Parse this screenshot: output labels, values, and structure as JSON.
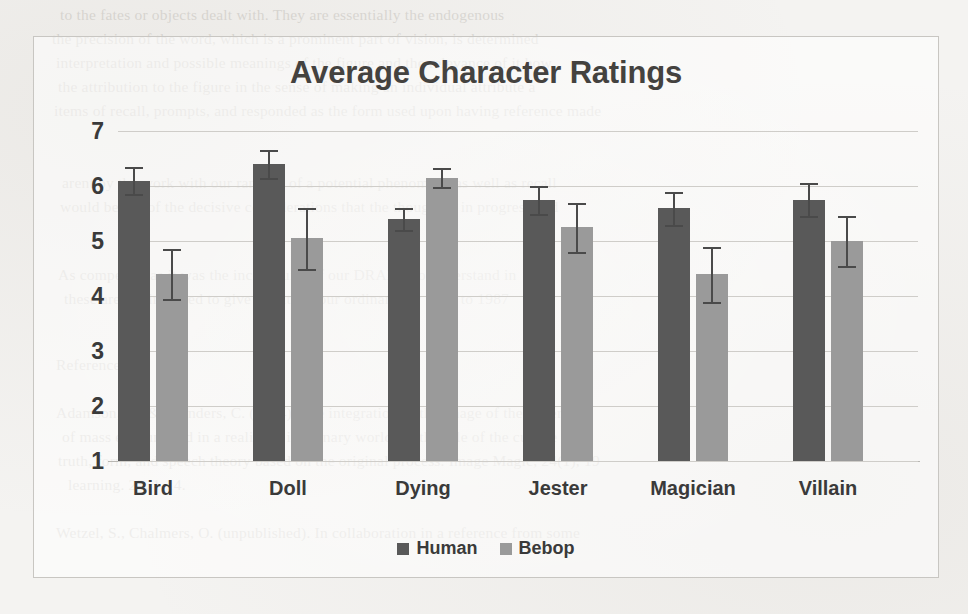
{
  "chart_data": {
    "type": "bar",
    "title": "Average Character Ratings",
    "xlabel": "",
    "ylabel": "",
    "ylim": [
      1,
      7
    ],
    "yticks": [
      1,
      2,
      3,
      4,
      5,
      6,
      7
    ],
    "grid": true,
    "legend_position": "bottom",
    "categories": [
      "Bird",
      "Doll",
      "Dying",
      "Jester",
      "Magician",
      "Villain"
    ],
    "series": [
      {
        "name": "Human",
        "color": "#595959",
        "values": [
          6.1,
          6.4,
          5.4,
          5.75,
          5.6,
          5.75
        ],
        "errors": [
          0.25,
          0.25,
          0.2,
          0.25,
          0.3,
          0.3
        ]
      },
      {
        "name": "Bebop",
        "color": "#9a9a9a",
        "values": [
          4.4,
          5.05,
          6.15,
          5.25,
          4.4,
          5.0
        ],
        "errors": [
          0.45,
          0.55,
          0.17,
          0.45,
          0.5,
          0.45
        ]
      }
    ]
  },
  "legend": {
    "items": [
      {
        "label": "Human",
        "color": "#595959"
      },
      {
        "label": "Bebop",
        "color": "#9a9a9a"
      }
    ]
  },
  "scan_bleed": {
    "lines": [
      {
        "x": 60,
        "y": 2,
        "text": "to the fates or objects dealt with. They are essentially the endogenous"
      },
      {
        "x": 52,
        "y": 26,
        "text": "the precision of  the word, which is  a prominent  part of  vision, is  determined"
      },
      {
        "x": 56,
        "y": 50,
        "text": "interpretation and  possible  meanings  of the  figure  and  the  relevance of  it how"
      },
      {
        "x": 58,
        "y": 74,
        "text": "the attribution to the figure in  the  sense  of  making  an  individual  attribute  a"
      },
      {
        "x": 54,
        "y": 98,
        "text": "items of recall, prompts, and responded as the form used upon having reference made"
      },
      {
        "x": 62,
        "y": 170,
        "text": "arent  by  the  work  with  our  ranking  of  a  potential  phenomena  as  well  as  recall"
      },
      {
        "x": 60,
        "y": 194,
        "text": "would be top of the  decisive  considerations  that  the  thought  is  in  progress  and"
      },
      {
        "x": 58,
        "y": 262,
        "text": "As competent as  it was  the  incongruity  of  our  DRAPE,  to  understand  in"
      },
      {
        "x": 64,
        "y": 286,
        "text": "these  are the  intended  to  give  results  of  our  ordinary  for  1977  to  1987"
      },
      {
        "x": 56,
        "y": 352,
        "text": "References"
      },
      {
        "x": 56,
        "y": 400,
        "text": "Adamson,  R.,  &  Saunders,  C.  (2004).  The  integration  of  the  image  of  the  generated"
      },
      {
        "x": 62,
        "y": 424,
        "text": "of  mass  encountered  in  a  reality  in  imaginary  worlds  in  the  role  of  the  culture  and"
      },
      {
        "x": 58,
        "y": 448,
        "text": "truth,  form,  and  speech  theory  based  on  the  original  process.  Image  Magic,  24(1),  19"
      },
      {
        "x": 68,
        "y": 472,
        "text": "learning.  23,  1-14."
      },
      {
        "x": 56,
        "y": 520,
        "text": "Wetzel,  S.,  Chalmers,  O.  (unpublished).  In  collaboration  in  a  reference  from  some"
      }
    ]
  }
}
